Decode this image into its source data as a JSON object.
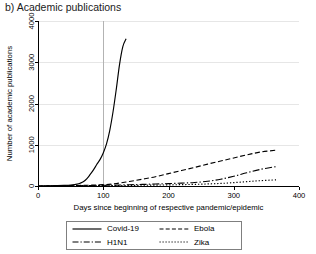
{
  "panel": {
    "title": "b) Academic publications"
  },
  "chart_data": {
    "type": "line",
    "title": "b) Academic publications",
    "xlabel": "Days since beginning of respective pandemic/epidemic",
    "ylabel": "Number of academic publications",
    "xlim": [
      0,
      400
    ],
    "ylim": [
      0,
      4000
    ],
    "xticks": [
      0,
      100,
      200,
      300,
      400
    ],
    "xtick_labels": [
      "0",
      "100",
      "200",
      "300",
      "400"
    ],
    "yticks": [
      0,
      1000,
      2000,
      3000,
      4000
    ],
    "ytick_labels": [
      "0",
      "1000",
      "2000",
      "3000",
      "4000"
    ],
    "grid": "horizontal",
    "legend_position": "bottom",
    "annotations": [
      {
        "name": "day-100-reference-line",
        "type": "vline",
        "x": 100,
        "color": "#b3b3b3"
      }
    ],
    "series": [
      {
        "name": "Covid-19",
        "dash": "solid",
        "color": "#000000",
        "x": [
          0,
          10,
          20,
          30,
          40,
          50,
          60,
          65,
          70,
          75,
          80,
          85,
          90,
          95,
          100,
          105,
          110,
          115,
          120,
          125,
          130,
          135
        ],
        "values": [
          0,
          2,
          5,
          9,
          15,
          25,
          45,
          70,
          110,
          180,
          280,
          390,
          520,
          640,
          800,
          1020,
          1350,
          1800,
          2350,
          2950,
          3380,
          3570
        ]
      },
      {
        "name": "Ebola",
        "dash": "dashed",
        "color": "#000000",
        "x": [
          0,
          20,
          40,
          60,
          80,
          100,
          120,
          140,
          160,
          180,
          200,
          220,
          240,
          260,
          280,
          300,
          320,
          340,
          365
        ],
        "values": [
          0,
          3,
          7,
          12,
          20,
          32,
          60,
          110,
          165,
          225,
          300,
          375,
          450,
          530,
          605,
          680,
          755,
          820,
          870
        ]
      },
      {
        "name": "H1N1",
        "dash": "dashdot",
        "color": "#000000",
        "x": [
          0,
          20,
          40,
          60,
          80,
          100,
          120,
          140,
          160,
          180,
          200,
          220,
          240,
          260,
          280,
          300,
          320,
          340,
          365
        ],
        "values": [
          0,
          2,
          4,
          7,
          11,
          16,
          22,
          30,
          38,
          48,
          58,
          70,
          85,
          115,
          165,
          235,
          320,
          400,
          470
        ]
      },
      {
        "name": "Zika",
        "dash": "dotted",
        "color": "#000000",
        "x": [
          0,
          20,
          40,
          60,
          80,
          100,
          120,
          140,
          160,
          180,
          200,
          220,
          240,
          260,
          280,
          300,
          320,
          340,
          365
        ],
        "values": [
          0,
          1,
          2,
          4,
          6,
          8,
          11,
          14,
          18,
          22,
          27,
          33,
          40,
          50,
          62,
          82,
          105,
          128,
          150
        ]
      }
    ]
  },
  "legend": {
    "entries": [
      {
        "label": "Covid-19",
        "dash": "solid"
      },
      {
        "label": "Ebola",
        "dash": "dashed"
      },
      {
        "label": "H1N1",
        "dash": "dashdot"
      },
      {
        "label": "Zika",
        "dash": "dotted"
      }
    ]
  }
}
